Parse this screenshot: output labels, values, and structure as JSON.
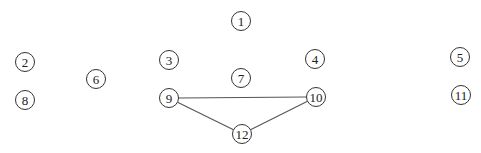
{
  "diagram": {
    "type": "graph",
    "nodes": [
      {
        "id": "1",
        "label": "1",
        "x": 241,
        "y": 21
      },
      {
        "id": "2",
        "label": "2",
        "x": 25,
        "y": 62
      },
      {
        "id": "3",
        "label": "3",
        "x": 169,
        "y": 60
      },
      {
        "id": "4",
        "label": "4",
        "x": 315,
        "y": 59
      },
      {
        "id": "5",
        "label": "5",
        "x": 460,
        "y": 57
      },
      {
        "id": "6",
        "label": "6",
        "x": 96,
        "y": 79
      },
      {
        "id": "7",
        "label": "7",
        "x": 241,
        "y": 78
      },
      {
        "id": "8",
        "label": "8",
        "x": 25,
        "y": 100
      },
      {
        "id": "9",
        "label": "9",
        "x": 169,
        "y": 98
      },
      {
        "id": "10",
        "label": "10",
        "x": 316,
        "y": 97
      },
      {
        "id": "11",
        "label": "11",
        "x": 461,
        "y": 95
      },
      {
        "id": "12",
        "label": "12",
        "x": 242,
        "y": 134
      }
    ],
    "edges": [
      {
        "from": "9",
        "to": "10"
      },
      {
        "from": "9",
        "to": "12"
      },
      {
        "from": "10",
        "to": "12"
      }
    ],
    "node_radius": 9.5
  }
}
